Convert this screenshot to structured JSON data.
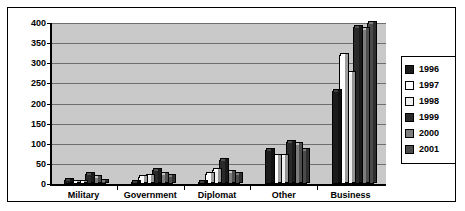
{
  "chart_data": {
    "type": "bar",
    "title": "",
    "subtitle": "",
    "xlabel": "",
    "ylabel": "",
    "ylim": [
      0,
      400
    ],
    "yticks": [
      0,
      50,
      100,
      150,
      200,
      250,
      300,
      350,
      400
    ],
    "grid": true,
    "legend_position": "right",
    "categories": [
      "Military",
      "Government",
      "Diplomat",
      "Other",
      "Business"
    ],
    "series": [
      {
        "name": "1996",
        "color": "#1c1c1c",
        "values": [
          10,
          5,
          5,
          85,
          230
        ]
      },
      {
        "name": "1997",
        "color": "#ffffff",
        "values": [
          5,
          18,
          25,
          70,
          320
        ]
      },
      {
        "name": "1998",
        "color": "#f0f0f0",
        "values": [
          3,
          20,
          35,
          70,
          275
        ]
      },
      {
        "name": "1999",
        "color": "#2a2a2a",
        "values": [
          25,
          35,
          60,
          105,
          390
        ]
      },
      {
        "name": "2000",
        "color": "#7d7d7d",
        "values": [
          18,
          25,
          30,
          100,
          385
        ]
      },
      {
        "name": "2001",
        "color": "#4a4a4a",
        "values": [
          8,
          20,
          25,
          85,
          400
        ]
      }
    ]
  },
  "legend": {
    "entries": [
      {
        "label": "1996"
      },
      {
        "label": "1997"
      },
      {
        "label": "1998"
      },
      {
        "label": "1999"
      },
      {
        "label": "2000"
      },
      {
        "label": "2001"
      }
    ]
  },
  "colors": {
    "plot_background": "#c9c9c9",
    "gridline": "#6e6e6e",
    "axis": "#000000",
    "frame": "#000000",
    "page_background": "#ffffff"
  }
}
